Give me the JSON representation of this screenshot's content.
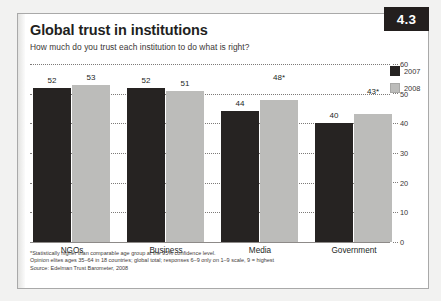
{
  "figure": {
    "number": "4.3",
    "title": "Global trust in institutions",
    "subtitle": "How much do you trust each institution to do what is right?"
  },
  "notes": [
    "*Statistically higher than comparable age group at the 95% confidence level.",
    "Opinion elites ages 35–64 in 18 countries; global total; responses 6–9 only on 1–9 scale, 9 = highest",
    "Source: Edelman Trust Barometer, 2008"
  ],
  "colors": {
    "series_2007": "#262322",
    "series_2008": "#bcbcba",
    "badge": "#231f1e",
    "text": "#231f1e",
    "grid": "#7d7a78",
    "card": "#ffffff",
    "page": "#f2f2f1"
  },
  "chart_data": {
    "type": "bar",
    "title": "Global trust in institutions",
    "subtitle": "How much do you trust each institution to do what is right?",
    "xlabel": "",
    "ylabel": "",
    "ylim": [
      0,
      60
    ],
    "yticks": [
      0,
      10,
      20,
      30,
      40,
      50,
      60
    ],
    "ytick_labels": [
      "0",
      "10",
      "20",
      "30",
      "40",
      "50",
      "60"
    ],
    "grid": true,
    "legend_position": "top-right",
    "categories": [
      "NGOs",
      "Business",
      "Media",
      "Government"
    ],
    "series": [
      {
        "name": "2007",
        "color": "#262322",
        "values": [
          52,
          52,
          44,
          40
        ],
        "labels": [
          "52",
          "52",
          "44",
          "40"
        ]
      },
      {
        "name": "2008",
        "color": "#bcbcba",
        "values": [
          53,
          51,
          48,
          43
        ],
        "labels": [
          "53",
          "51",
          "48*",
          "43*"
        ]
      }
    ]
  }
}
